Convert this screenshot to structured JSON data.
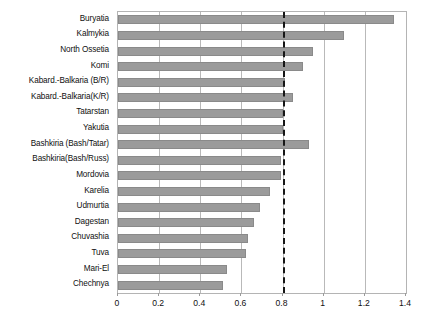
{
  "chart_data": {
    "type": "bar",
    "orientation": "horizontal",
    "title": "",
    "subtitle": "",
    "xlabel": "",
    "ylabel": "",
    "xlim": [
      0,
      1.4
    ],
    "ylim": null,
    "grid": true,
    "legend": null,
    "legend_position": "none",
    "bar_color": "#9b9b9b",
    "bar_border_color": "#8a8a8a",
    "frame_color": "#b4b4b4",
    "gridline_color": "#b9b9b9",
    "xticks": [
      "0",
      "0.2",
      "0.4",
      "0.6",
      "0.8",
      "1",
      "1.2",
      "1.4"
    ],
    "xtick_values": [
      0,
      0.2,
      0.4,
      0.6,
      0.8,
      1,
      1.2,
      1.4
    ],
    "categories": [
      "Buryatia",
      "Kalmykia",
      "North Ossetia",
      "Komi",
      "Kabard.-Balkaria (B/R)",
      "Kabard.-Balkaria(K/R)",
      "Tatarstan",
      "Yakutia",
      "Bashkiria (Bash/Tatar)",
      "Bashkiria(Bash/Russ)",
      "Mordovia",
      "Karelia",
      "Udmurtia",
      "Dagestan",
      "Chuvashia",
      "Tuva",
      "Mari-El",
      "Chechnya"
    ],
    "values": [
      1.34,
      1.1,
      0.95,
      0.9,
      0.81,
      0.85,
      0.8,
      0.8,
      0.93,
      0.79,
      0.79,
      0.74,
      0.69,
      0.66,
      0.63,
      0.62,
      0.53,
      0.51
    ],
    "annotations": [
      {
        "name": "threshold-line",
        "type": "vertical-reference-line",
        "value": 0.8,
        "style": "dash-dot",
        "color": "#161616",
        "label": ""
      }
    ]
  }
}
